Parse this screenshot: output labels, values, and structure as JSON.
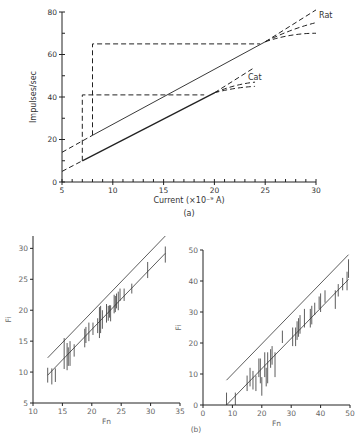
{
  "chart_data": [
    {
      "panel": "(a)",
      "type": "line",
      "xlabel": "Current (×10⁻⁹ A)",
      "ylabel": "Impulses/sec",
      "xlim": [
        5,
        30
      ],
      "ylim": [
        0,
        80
      ],
      "xticks": [
        5,
        10,
        15,
        20,
        25,
        30
      ],
      "yticks": [
        0,
        20,
        40,
        60,
        80
      ],
      "series": [
        {
          "name": "Rat",
          "solid": [
            [
              8,
              22
            ],
            [
              25,
              66
            ]
          ],
          "dashed_extension_low": [
            [
              5,
              14
            ],
            [
              8,
              22
            ]
          ],
          "dashed_extension_high": [
            [
              25,
              66
            ],
            [
              30,
              81
            ]
          ],
          "saturation_curves": [
            [
              [
                25,
                66
              ],
              [
                27.5,
                72
              ],
              [
                30,
                75
              ]
            ],
            [
              [
                25,
                66
              ],
              [
                27.5,
                70
              ],
              [
                30,
                70
              ]
            ]
          ],
          "step": {
            "x": 8,
            "y_low": 22,
            "y_high": 65,
            "x_end": 24.5
          }
        },
        {
          "name": "Cat",
          "solid": [
            [
              7,
              10
            ],
            [
              20,
              42
            ]
          ],
          "dashed_extension_low": [
            [
              5,
              5
            ],
            [
              7,
              10
            ]
          ],
          "dashed_extension_high": [
            [
              20,
              42
            ],
            [
              24,
              54
            ]
          ],
          "saturation_curves": [
            [
              [
                20,
                42
              ],
              [
                22,
                46
              ],
              [
                24,
                47
              ]
            ],
            [
              [
                20,
                42
              ],
              [
                22,
                44.5
              ],
              [
                24,
                45
              ]
            ]
          ],
          "step": {
            "x": 7,
            "y_low": 10,
            "y_high": 41,
            "x_end": 19
          }
        }
      ]
    },
    {
      "panel": "(b) left",
      "type": "scatter",
      "xlabel": "Fn",
      "ylabel": "Fi",
      "xlim": [
        10,
        35
      ],
      "ylim": [
        5,
        32
      ],
      "xticks": [
        10,
        15,
        20,
        25,
        30,
        35
      ],
      "yticks": [
        5,
        10,
        15,
        20,
        25,
        30
      ],
      "lines": [
        {
          "name": "upper",
          "points": [
            [
              12.5,
              12.3
            ],
            [
              32.5,
              32
            ]
          ]
        },
        {
          "name": "regression",
          "points": [
            [
              12.5,
              9.5
            ],
            [
              32.5,
              29.2
            ]
          ]
        }
      ],
      "error_bars": [
        [
          12.5,
          9.5,
          1.2
        ],
        [
          13.2,
          9.3,
          1.3
        ],
        [
          13.8,
          9.5,
          1.1
        ],
        [
          15.3,
          13,
          2.5
        ],
        [
          15.8,
          12.5,
          2.2
        ],
        [
          16,
          12.5,
          1.5
        ],
        [
          16.3,
          13,
          2
        ],
        [
          17,
          13.5,
          1.0
        ],
        [
          18.8,
          15.5,
          1.5
        ],
        [
          19,
          16,
          1.3
        ],
        [
          19.5,
          16.5,
          1.5
        ],
        [
          20.2,
          17,
          1.0
        ],
        [
          21,
          17.5,
          1.2
        ],
        [
          21.3,
          18,
          2.5
        ],
        [
          21.5,
          18.5,
          2.2
        ],
        [
          21.8,
          18.5,
          1.5
        ],
        [
          22.5,
          19.5,
          1.5
        ],
        [
          22.8,
          19.5,
          1.2
        ],
        [
          23,
          19.8,
          1.0
        ],
        [
          23.2,
          19.5,
          1.3
        ],
        [
          23.8,
          21,
          1.5
        ],
        [
          24,
          21,
          1.3
        ],
        [
          24.2,
          21.5,
          1.2
        ],
        [
          24.5,
          21.5,
          1.5
        ],
        [
          24.8,
          22.5,
          1.0
        ],
        [
          25.5,
          22.5,
          1.0
        ],
        [
          26.8,
          23.5,
          0.8
        ],
        [
          29.5,
          26.5,
          1.3
        ],
        [
          32.5,
          29,
          1.3
        ]
      ]
    },
    {
      "panel": "(b) right",
      "type": "scatter",
      "xlabel": "Fn",
      "ylabel": "Fi",
      "xlim": [
        0,
        50
      ],
      "ylim": [
        0,
        50
      ],
      "xticks": [
        0,
        10,
        20,
        30,
        40,
        50
      ],
      "yticks": [
        0,
        10,
        20,
        30,
        40,
        50
      ],
      "lines": [
        {
          "name": "upper",
          "points": [
            [
              8,
              8
            ],
            [
              49.5,
              48.5
            ]
          ]
        },
        {
          "name": "regression",
          "points": [
            [
              8,
              0
            ],
            [
              49.5,
              40.5
            ]
          ]
        }
      ],
      "error_bars": [
        [
          8,
          2,
          2
        ],
        [
          11,
          2,
          2
        ],
        [
          15,
          7,
          2.5
        ],
        [
          16,
          9,
          3
        ],
        [
          17,
          8,
          3
        ],
        [
          18,
          7,
          2.5
        ],
        [
          19,
          12,
          3
        ],
        [
          19.5,
          11,
          4
        ],
        [
          20,
          6,
          3
        ],
        [
          21,
          13,
          4
        ],
        [
          21.5,
          9,
          3
        ],
        [
          22,
          12,
          5
        ],
        [
          23,
          15,
          3
        ],
        [
          23.5,
          16,
          3
        ],
        [
          24.5,
          13,
          4
        ],
        [
          27,
          22,
          2
        ],
        [
          30.5,
          22,
          3
        ],
        [
          31.5,
          22,
          3
        ],
        [
          32,
          24,
          3
        ],
        [
          32.5,
          25,
          3
        ],
        [
          33,
          26,
          3
        ],
        [
          34.5,
          28,
          3
        ],
        [
          36.5,
          28,
          3
        ],
        [
          37,
          29,
          3
        ],
        [
          38,
          31,
          2
        ],
        [
          39.5,
          33,
          2
        ],
        [
          40,
          33,
          3
        ],
        [
          41.5,
          35,
          2
        ],
        [
          45,
          34,
          3
        ],
        [
          46,
          37,
          2
        ],
        [
          47.5,
          39,
          2
        ],
        [
          49,
          40,
          3
        ],
        [
          49.5,
          44,
          3
        ]
      ]
    }
  ],
  "labels": {
    "panel_a": "(a)",
    "panel_b": "(b)",
    "rat": "Rat",
    "cat": "Cat"
  }
}
